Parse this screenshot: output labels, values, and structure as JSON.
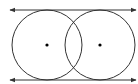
{
  "diagram": {
    "stroke_color": "#333333",
    "circles": [
      {
        "cx": 47,
        "cy": 45,
        "r": 35
      },
      {
        "cx": 100,
        "cy": 45,
        "r": 35
      }
    ],
    "lines": [
      {
        "y": 10,
        "x1": 10,
        "x2": 136,
        "arrows": "both"
      },
      {
        "y": 80,
        "x1": 10,
        "x2": 136,
        "arrows": "both"
      }
    ]
  }
}
